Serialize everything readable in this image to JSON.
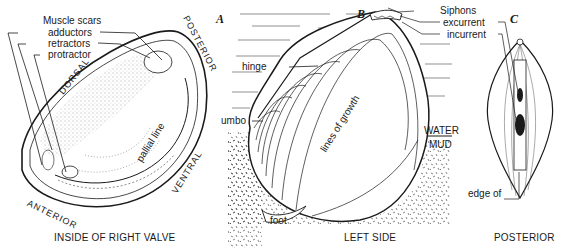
{
  "figure": {
    "panels": [
      {
        "id": "A",
        "letter": "A",
        "caption": "INSIDE OF RIGHT VALVE",
        "labels": {
          "muscle_scars": "Muscle scars",
          "adductors": "adductors",
          "retractors": "retractors",
          "protractor": "protractor",
          "pallial_line": "pallial line"
        },
        "orientation": {
          "dorsal": "DORSAL",
          "posterior": "POSTERIOR",
          "ventral": "VENTRAL",
          "anterior": "ANTERIOR"
        }
      },
      {
        "id": "B",
        "letter": "B",
        "caption": "LEFT SIDE",
        "labels": {
          "siphons": "Siphons",
          "excurrent": "excurrent",
          "incurrent": "incurrent",
          "hinge": "hinge",
          "umbo": "umbo",
          "lines_of_growth": "lines of growth",
          "water": "WATER",
          "mud": "MUD",
          "foot": "foot"
        }
      },
      {
        "id": "C",
        "letter": "C",
        "caption": "POSTERIOR",
        "labels": {
          "edge_of_mantle_1": "edge of",
          "edge_of_mantle_2": "mantle"
        }
      }
    ],
    "colors": {
      "ink": "#1a1a1a",
      "paper": "#ffffff"
    }
  }
}
